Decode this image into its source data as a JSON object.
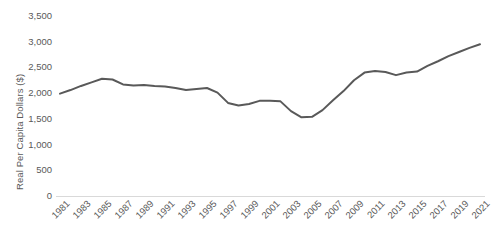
{
  "chart_data": {
    "type": "line",
    "title": "",
    "xlabel": "",
    "ylabel": "Real Per Capita Dollars ($)",
    "ylim": [
      0,
      3500
    ],
    "ytick_values": [
      0,
      500,
      1000,
      1500,
      2000,
      2500,
      3000,
      3500
    ],
    "ytick_labels": [
      "0",
      "500",
      "1,000",
      "1,500",
      "2,000",
      "2,500",
      "3,000",
      "3,500"
    ],
    "xlim": [
      1981,
      2021
    ],
    "xtick_labels": [
      "1981",
      "1983",
      "1985",
      "1987",
      "1989",
      "1991",
      "1993",
      "1995",
      "1997",
      "1999",
      "2001",
      "2003",
      "2005",
      "2007",
      "2009",
      "2011",
      "2013",
      "2015",
      "2017",
      "2019",
      "2021"
    ],
    "grid": false,
    "legend": false,
    "line_color": "#595959",
    "axis_color": "#d9d9d9",
    "text_color": "#595959",
    "x": [
      1981,
      1982,
      1983,
      1984,
      1985,
      1986,
      1987,
      1988,
      1989,
      1990,
      1991,
      1992,
      1993,
      1994,
      1995,
      1996,
      1997,
      1998,
      1999,
      2000,
      2001,
      2002,
      2003,
      2004,
      2005,
      2006,
      2007,
      2008,
      2009,
      2010,
      2011,
      2012,
      2013,
      2014,
      2015,
      2016,
      2017,
      2018,
      2019,
      2020,
      2021
    ],
    "values": [
      1990,
      2060,
      2140,
      2210,
      2280,
      2265,
      2170,
      2150,
      2160,
      2140,
      2130,
      2100,
      2060,
      2080,
      2100,
      2010,
      1810,
      1760,
      1790,
      1850,
      1850,
      1840,
      1650,
      1530,
      1540,
      1670,
      1860,
      2040,
      2250,
      2400,
      2430,
      2410,
      2350,
      2400,
      2420,
      2530,
      2620,
      2720,
      2800,
      2880,
      2950
    ]
  }
}
